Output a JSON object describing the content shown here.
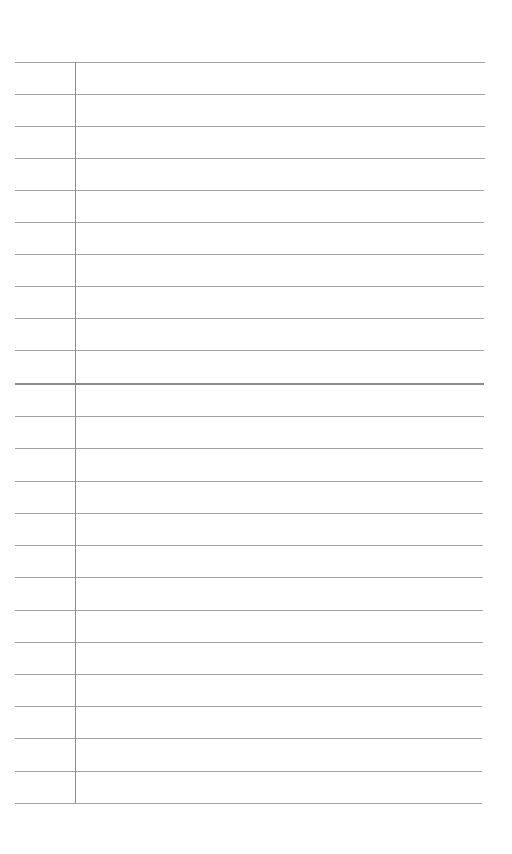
{
  "page": {
    "type": "ruled notepad page",
    "background_color": "#ffffff",
    "text_content": ""
  },
  "rules": {
    "color": "#a3a3a3",
    "heavy_color": "#8c8c8c",
    "left": 15,
    "right_top": 485,
    "right_bottom": 482,
    "y_positions": [
      62,
      94,
      126,
      158,
      190,
      222,
      254,
      286,
      318,
      350,
      384,
      416,
      448,
      481,
      513,
      545,
      577,
      610,
      642,
      674,
      706,
      738,
      771,
      803
    ],
    "heavy_index": 10
  },
  "margin": {
    "x": 75,
    "top": 62,
    "bottom": 803,
    "color": "#8a8a8a"
  }
}
